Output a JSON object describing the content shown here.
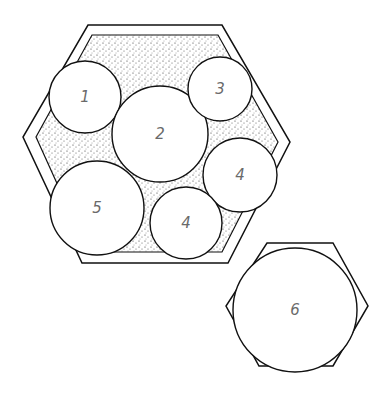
{
  "diagram": {
    "type": "circle-packing-in-hexagon",
    "colors": {
      "stroke": "#111111",
      "stipple": "#333333",
      "label": "#6a6a6a",
      "fill": "#ffffff"
    },
    "main_hexagon": {
      "outer": [
        [
          88,
          25
        ],
        [
          222,
          25
        ],
        [
          290,
          142
        ],
        [
          228,
          263
        ],
        [
          82,
          263
        ],
        [
          23,
          137
        ]
      ],
      "inner": [
        [
          92,
          35
        ],
        [
          218,
          35
        ],
        [
          278,
          142
        ],
        [
          222,
          252
        ],
        [
          88,
          252
        ],
        [
          36,
          137
        ]
      ]
    },
    "circles": [
      {
        "id": "c1",
        "label": "1",
        "cx": 85,
        "cy": 97,
        "r": 36
      },
      {
        "id": "c2",
        "label": "2",
        "cx": 160,
        "cy": 134,
        "r": 48
      },
      {
        "id": "c3",
        "label": "3",
        "cx": 220,
        "cy": 89,
        "r": 32
      },
      {
        "id": "c4a",
        "label": "4",
        "cx": 240,
        "cy": 175,
        "r": 37
      },
      {
        "id": "c4b",
        "label": "4",
        "cx": 186,
        "cy": 223,
        "r": 36
      },
      {
        "id": "c5",
        "label": "5",
        "cx": 97,
        "cy": 208,
        "r": 47
      }
    ],
    "small_hexagon": {
      "points": [
        [
          267,
          243
        ],
        [
          333,
          243
        ],
        [
          368,
          306
        ],
        [
          333,
          366
        ],
        [
          259,
          366
        ],
        [
          226,
          306
        ]
      ],
      "circle": {
        "id": "c6",
        "label": "6",
        "cx": 295,
        "cy": 310,
        "r": 62
      }
    }
  }
}
